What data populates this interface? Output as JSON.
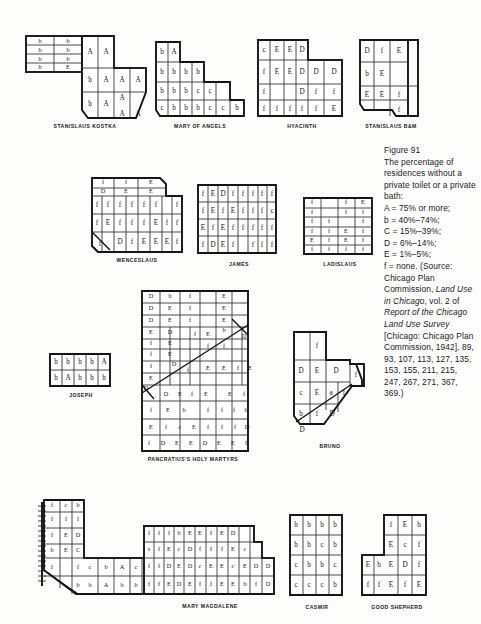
{
  "figure": {
    "number": "Figure 91",
    "caption_text": "The percentage of residences without a private toilet or a private bath:",
    "legend": [
      "A = 75% or more;",
      "b = 40%–74%;",
      "C = 15%–39%;",
      "D = 6%–14%;",
      "E = 1%–5%;",
      "f = none."
    ],
    "source_prefix": "(Source: Chicago Plan Commission, ",
    "source_italic_1": "Land Use in Chicago",
    "source_mid_1": ", vol. 2 of ",
    "source_italic_2": "Report of the Chicago Land Use Survey",
    "source_tail": " [Chicago: Chicago Plan Commission, 1942], 89, 93, 107, 113, 127, 135, 153, 155, 211, 215, 247, 267, 271, 367, 369.)"
  },
  "maps": {
    "stanislaus_kostka": {
      "label": "STANISLAUS KOSTKA",
      "cells": [
        "b",
        "b",
        "A",
        "A",
        "b",
        "b",
        "A",
        "A",
        "b",
        "b",
        "b",
        "A",
        "A",
        "A",
        "b",
        "E",
        "b",
        "A",
        "A",
        "A",
        "A",
        "A",
        "A",
        "A",
        "A",
        "A"
      ]
    },
    "mary_of_angels": {
      "label": "MARY OF ANGELS",
      "cells": [
        "b",
        "A",
        "b",
        "b",
        "b",
        "b",
        "b",
        "b",
        "b",
        "c",
        "c",
        "c",
        "b",
        "b",
        "b",
        "c",
        "c",
        "b"
      ]
    },
    "hyacinth": {
      "label": "HYACINTH",
      "cells": [
        "c",
        "E",
        "E",
        "D",
        "f",
        "E",
        "E",
        "D",
        "D",
        "D",
        "f",
        "D",
        "f",
        "f",
        "f",
        "f",
        "f",
        "f",
        "f",
        "E"
      ]
    },
    "stanislaus_bm": {
      "label": "STANISLAUS B&M",
      "cells": [
        "D",
        "f",
        "E",
        "b",
        "E",
        "E",
        "E",
        "f",
        "f"
      ]
    },
    "wenceslaus": {
      "label": "WENCESLAUS",
      "cells": [
        "f",
        "f",
        "E",
        "D",
        "E",
        "E",
        "f",
        "f",
        "f",
        "f",
        "f",
        "f",
        "f",
        "f",
        "E",
        "f",
        "f",
        "f",
        "E",
        "f",
        "f",
        "f",
        "D",
        "f",
        "E",
        "E",
        "E",
        "f"
      ]
    },
    "james": {
      "label": "JAMES",
      "cells": [
        "f",
        "E",
        "D",
        "f",
        "f",
        "f",
        "f",
        "f",
        "f",
        "E",
        "f",
        "E",
        "f",
        "f",
        "f",
        "c",
        "E",
        "f",
        "E",
        "f",
        "f",
        "f",
        "f",
        "f",
        "f",
        "D",
        "E",
        "f",
        "f",
        "f",
        "f"
      ]
    },
    "ladislaus": {
      "label": "LADISLAUS",
      "cells": [
        "f",
        "f",
        "E",
        "f",
        "f",
        "f",
        "f",
        "f",
        "f",
        "f",
        "f",
        "E",
        "f",
        "E",
        "f",
        "f",
        "f",
        "f",
        "f",
        "f"
      ]
    },
    "joseph": {
      "label": "JOSEPH",
      "cells": [
        "b",
        "b",
        "b",
        "b",
        "A",
        "b",
        "A",
        "b",
        "b",
        "b"
      ]
    },
    "pancratius": {
      "label": "PANCRATIUS'S HOLY MARTYRS",
      "cells": [
        "D",
        "b",
        "f",
        "E",
        "D",
        "E",
        "f",
        "E",
        "D",
        "E",
        "f",
        "E",
        "E",
        "D",
        "f",
        "E",
        "D",
        "f",
        "E",
        "f",
        "f",
        "E",
        "f",
        "f",
        "D",
        "f",
        "E",
        "E",
        "f",
        "E",
        "E",
        "f",
        "E",
        "D",
        "D",
        "E",
        "f",
        "E",
        "E",
        "f",
        "f",
        "E",
        "b",
        "f",
        "f",
        "f",
        "b",
        "E",
        "f",
        "c",
        "E",
        "f",
        "f",
        "f",
        "D",
        "f",
        "D",
        "E",
        "E",
        "D",
        "E",
        "E",
        "f"
      ]
    },
    "bruno": {
      "label": "BRUNO",
      "cells": [
        "f",
        "D",
        "E",
        "D",
        "c",
        "E",
        "a",
        "f",
        "D",
        "f",
        "b",
        "f",
        "D",
        "D"
      ]
    },
    "stanislaus_bottom": {
      "label": "",
      "cells": [
        "f",
        "c",
        "b",
        "f",
        "f",
        "f",
        "f",
        "f",
        "E",
        "D",
        "c",
        "b",
        "E",
        "b",
        "C",
        "f",
        "f",
        "b",
        "c",
        "b",
        "A",
        "c",
        "b",
        "A",
        "b",
        "b"
      ]
    },
    "mary_magdalene": {
      "label": "MARY MAGDALENE",
      "cells": [
        "f",
        "f",
        "f",
        "b",
        "E",
        "E",
        "f",
        "E",
        "D",
        "s",
        "f",
        "E",
        "c",
        "D",
        "f",
        "f",
        "f",
        "E",
        "c",
        "f",
        "f",
        "D",
        "E",
        "D",
        "c",
        "E",
        "E",
        "c",
        "E",
        "D",
        "D",
        "f",
        "f",
        "E",
        "D",
        "E",
        "f",
        "f",
        "E",
        "E",
        "b",
        "f",
        "D"
      ]
    },
    "casmir": {
      "label": "CASMIR",
      "cells": [
        "b",
        "b",
        "b",
        "b",
        "b",
        "b",
        "c",
        "b",
        "c",
        "b",
        "b",
        "c",
        "c",
        "c",
        "c",
        "b"
      ]
    },
    "good_shepherd": {
      "label": "GOOD SHEPHERD",
      "cells": [
        "f",
        "E",
        "b",
        "E",
        "c",
        "f",
        "E",
        "b",
        "E",
        "D",
        "f",
        "f",
        "f",
        "E",
        "f",
        "E"
      ]
    }
  }
}
